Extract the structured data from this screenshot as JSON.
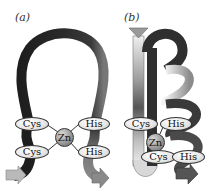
{
  "panels": {
    "a": {
      "label": "(a)",
      "residues": {
        "cys_top": "Cys",
        "cys_bottom": "Cys",
        "his_top": "His",
        "his_bottom": "His",
        "zinc": "Zn"
      }
    },
    "b": {
      "label": "(b)",
      "residues": {
        "cys_top": "Cys",
        "cys_bottom": "Cys",
        "his_top": "His",
        "his_bottom": "His",
        "zinc": "Zn"
      }
    }
  },
  "colors": {
    "ribbon_dark": "#2b2b2b",
    "ribbon_mid": "#808080",
    "ribbon_light": "#e0e0e0",
    "zinc": "#9a9a9a",
    "background": "#ffffff"
  }
}
